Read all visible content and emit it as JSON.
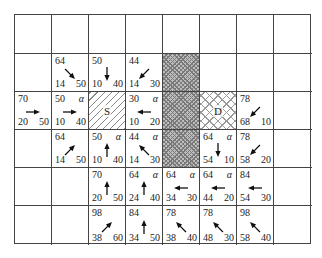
{
  "diagram": {
    "grid": {
      "cols": 8,
      "rows": 6
    },
    "legend": {
      "start_label": "S",
      "dest_label": "D",
      "closed_marker": "α"
    },
    "obstacles": [
      {
        "row": 1,
        "col": 4
      },
      {
        "row": 2,
        "col": 4
      },
      {
        "row": 3,
        "col": 4
      }
    ],
    "start": {
      "row": 2,
      "col": 2,
      "label": "S"
    },
    "dest": {
      "row": 2,
      "col": 5,
      "label": "D"
    },
    "cells": [
      {
        "row": 1,
        "col": 1,
        "f": "64",
        "g": "14",
        "h": "50",
        "alpha": "",
        "arrow": "se"
      },
      {
        "row": 1,
        "col": 2,
        "f": "50",
        "g": "10",
        "h": "40",
        "alpha": "",
        "arrow": "s"
      },
      {
        "row": 1,
        "col": 3,
        "f": "44",
        "g": "14",
        "h": "30",
        "alpha": "",
        "arrow": "sw"
      },
      {
        "row": 2,
        "col": 0,
        "f": "70",
        "g": "20",
        "h": "50",
        "alpha": "",
        "arrow": "e"
      },
      {
        "row": 2,
        "col": 1,
        "f": "50",
        "g": "10",
        "h": "40",
        "alpha": "α",
        "arrow": "e"
      },
      {
        "row": 2,
        "col": 3,
        "f": "30",
        "g": "10",
        "h": "20",
        "alpha": "α",
        "arrow": "w"
      },
      {
        "row": 2,
        "col": 6,
        "f": "78",
        "g": "68",
        "h": "10",
        "alpha": "",
        "arrow": "sw"
      },
      {
        "row": 3,
        "col": 1,
        "f": "64",
        "g": "14",
        "h": "50",
        "alpha": "",
        "arrow": "ne"
      },
      {
        "row": 3,
        "col": 2,
        "f": "50",
        "g": "10",
        "h": "40",
        "alpha": "α",
        "arrow": "n"
      },
      {
        "row": 3,
        "col": 3,
        "f": "44",
        "g": "14",
        "h": "30",
        "alpha": "α",
        "arrow": "nw"
      },
      {
        "row": 3,
        "col": 5,
        "f": "64",
        "g": "54",
        "h": "10",
        "alpha": "α",
        "arrow": "s"
      },
      {
        "row": 3,
        "col": 6,
        "f": "78",
        "g": "58",
        "h": "20",
        "alpha": "",
        "arrow": "sw"
      },
      {
        "row": 4,
        "col": 2,
        "f": "70",
        "g": "20",
        "h": "50",
        "alpha": "",
        "arrow": "n"
      },
      {
        "row": 4,
        "col": 3,
        "f": "64",
        "g": "24",
        "h": "40",
        "alpha": "α",
        "arrow": "n"
      },
      {
        "row": 4,
        "col": 4,
        "f": "64",
        "g": "34",
        "h": "30",
        "alpha": "α",
        "arrow": "w"
      },
      {
        "row": 4,
        "col": 5,
        "f": "64",
        "g": "44",
        "h": "20",
        "alpha": "α",
        "arrow": "w"
      },
      {
        "row": 4,
        "col": 6,
        "f": "84",
        "g": "54",
        "h": "30",
        "alpha": "",
        "arrow": "w"
      },
      {
        "row": 5,
        "col": 2,
        "f": "98",
        "g": "38",
        "h": "60",
        "alpha": "",
        "arrow": "ne"
      },
      {
        "row": 5,
        "col": 3,
        "f": "84",
        "g": "34",
        "h": "50",
        "alpha": "",
        "arrow": "n"
      },
      {
        "row": 5,
        "col": 4,
        "f": "78",
        "g": "38",
        "h": "40",
        "alpha": "",
        "arrow": "nw"
      },
      {
        "row": 5,
        "col": 5,
        "f": "78",
        "g": "48",
        "h": "30",
        "alpha": "",
        "arrow": "nw"
      },
      {
        "row": 5,
        "col": 6,
        "f": "98",
        "g": "58",
        "h": "40",
        "alpha": "",
        "arrow": "nw"
      }
    ]
  }
}
